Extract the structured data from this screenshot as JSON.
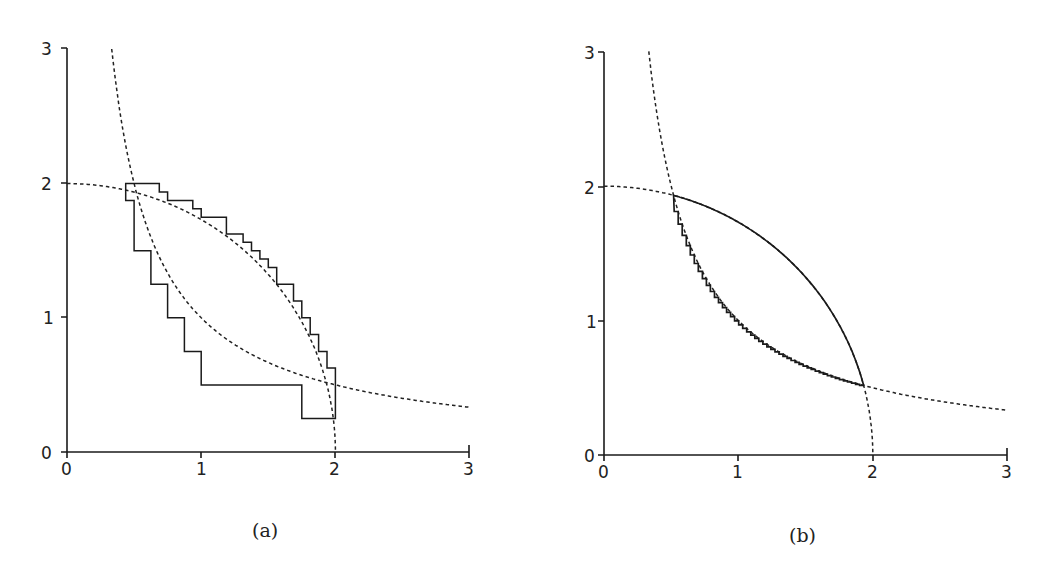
{
  "figure": {
    "panels": [
      {
        "id": "a",
        "caption": "(a)"
      },
      {
        "id": "b",
        "caption": "(b)"
      }
    ]
  },
  "chart_data": [
    {
      "type": "line",
      "title": "(a)",
      "xlabel": "",
      "ylabel": "",
      "xlim": [
        0,
        3
      ],
      "ylim": [
        0,
        3
      ],
      "xticks": [
        "0",
        "1",
        "2",
        "3"
      ],
      "yticks": [
        "0",
        "1",
        "2",
        "3"
      ],
      "grid": false,
      "series": [
        {
          "name": "circle x^2+y^2=4 (dashed)",
          "style": "dashed",
          "function": "y=sqrt(4-x^2)",
          "x_range": [
            0,
            2
          ]
        },
        {
          "name": "hyperbola xy=1 (dashed)",
          "style": "dashed",
          "function": "y=1/x",
          "x_range": [
            0.333,
            3
          ]
        },
        {
          "name": "staircase approximation (solid)",
          "style": "solid",
          "points": [
            [
              0.4375,
              1.875
            ],
            [
              0.4375,
              2.0
            ],
            [
              0.6875,
              2.0
            ],
            [
              0.6875,
              1.9375
            ],
            [
              0.75,
              1.9375
            ],
            [
              0.75,
              1.875
            ],
            [
              0.9375,
              1.875
            ],
            [
              0.9375,
              1.8125
            ],
            [
              1.0,
              1.8125
            ],
            [
              1.0,
              1.75
            ],
            [
              1.1875,
              1.75
            ],
            [
              1.1875,
              1.625
            ],
            [
              1.3125,
              1.625
            ],
            [
              1.3125,
              1.5625
            ],
            [
              1.375,
              1.5625
            ],
            [
              1.375,
              1.5
            ],
            [
              1.4375,
              1.5
            ],
            [
              1.4375,
              1.4375
            ],
            [
              1.5,
              1.4375
            ],
            [
              1.5,
              1.375
            ],
            [
              1.5625,
              1.375
            ],
            [
              1.5625,
              1.25
            ],
            [
              1.6875,
              1.25
            ],
            [
              1.6875,
              1.125
            ],
            [
              1.75,
              1.125
            ],
            [
              1.75,
              1.0
            ],
            [
              1.8125,
              1.0
            ],
            [
              1.8125,
              0.875
            ],
            [
              1.875,
              0.875
            ],
            [
              1.875,
              0.75
            ],
            [
              1.9375,
              0.75
            ],
            [
              1.9375,
              0.625
            ],
            [
              2.0,
              0.625
            ],
            [
              2.0,
              0.25
            ],
            [
              1.75,
              0.25
            ],
            [
              1.75,
              0.5
            ],
            [
              1.0,
              0.5
            ],
            [
              1.0,
              0.75
            ],
            [
              0.875,
              0.75
            ],
            [
              0.875,
              1.0
            ],
            [
              0.75,
              1.0
            ],
            [
              0.75,
              1.25
            ],
            [
              0.625,
              1.25
            ],
            [
              0.625,
              1.5
            ],
            [
              0.5,
              1.5
            ],
            [
              0.5,
              1.875
            ],
            [
              0.4375,
              1.875
            ]
          ]
        }
      ]
    },
    {
      "type": "line",
      "title": "(b)",
      "xlabel": "",
      "ylabel": "",
      "xlim": [
        0,
        3
      ],
      "ylim": [
        0,
        3
      ],
      "xticks": [
        "0",
        "1",
        "2",
        "3"
      ],
      "yticks": [
        "0",
        "1",
        "2",
        "3"
      ],
      "grid": false,
      "series": [
        {
          "name": "circle x^2+y^2=4 (dashed)",
          "style": "dashed",
          "function": "y=sqrt(4-x^2)",
          "x_range": [
            0,
            2
          ]
        },
        {
          "name": "hyperbola xy=1 (dashed)",
          "style": "dashed",
          "function": "y=1/x",
          "x_range": [
            0.333,
            3
          ]
        },
        {
          "name": "lens region boundary (solid, fine staircase along hyperbola)",
          "style": "solid",
          "intersections": [
            [
              0.518,
              1.932
            ],
            [
              1.932,
              0.518
            ]
          ],
          "step": 0.03
        }
      ]
    }
  ]
}
